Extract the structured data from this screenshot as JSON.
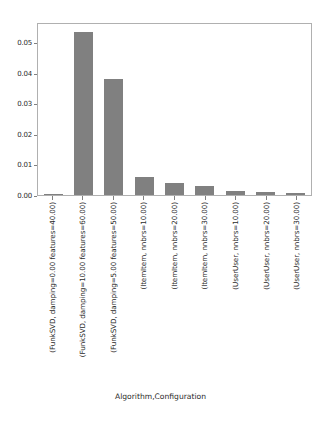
{
  "chart_data": {
    "type": "bar",
    "title": "",
    "xlabel": "Algorithm,Configuration",
    "ylabel": "",
    "ylim": [
      0.0,
      0.0565
    ],
    "grid": false,
    "legend": null,
    "bar_color": "#808080",
    "categories": [
      "(FunkSVD, damping=0.00 features=40.00)",
      "(FunkSVD, damping=10.00 features=60.00)",
      "(FunkSVD, damping=5.00 features=50.00)",
      "(ItemItem, nnbrs=10.00)",
      "(ItemItem, nnbrs=20.00)",
      "(ItemItem, nnbrs=30.00)",
      "(UserUser, nnbrs=10.00)",
      "(UserUser, nnbrs=20.00)",
      "(UserUser, nnbrs=30.00)"
    ],
    "values": [
      0.0002,
      0.0537,
      0.0382,
      0.0061,
      0.004,
      0.003,
      0.0013,
      0.0011,
      0.0008
    ],
    "yticks": [
      "0.00",
      "0.01",
      "0.02",
      "0.03",
      "0.04",
      "0.05"
    ],
    "ytick_values": [
      0.0,
      0.01,
      0.02,
      0.03,
      0.04,
      0.05
    ]
  }
}
